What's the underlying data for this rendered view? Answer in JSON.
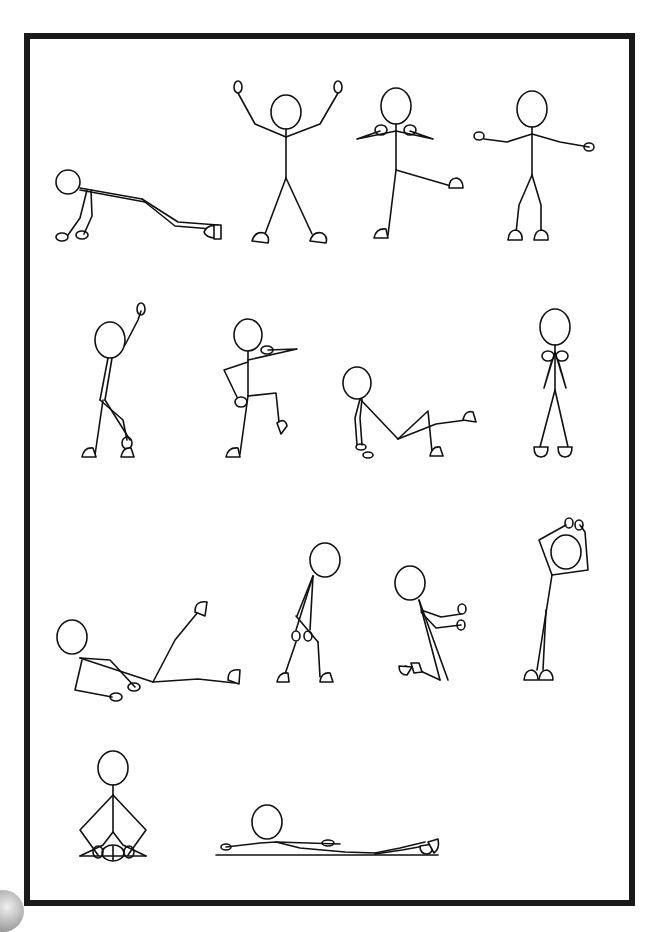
{
  "page": {
    "frame_color": "#1a1a1a",
    "background": "#ffffff",
    "line_color": "#111111"
  },
  "poses": [
    {
      "row": 1,
      "index": 1,
      "name": "plank / push-up"
    },
    {
      "row": 1,
      "index": 2,
      "name": "arms raised star stance"
    },
    {
      "row": 1,
      "index": 3,
      "name": "standing side leg kick"
    },
    {
      "row": 1,
      "index": 4,
      "name": "standing arms out"
    },
    {
      "row": 2,
      "index": 1,
      "name": "side stretch arm up"
    },
    {
      "row": 2,
      "index": 2,
      "name": "knee raise with arm point"
    },
    {
      "row": 2,
      "index": 3,
      "name": "seated leg raise"
    },
    {
      "row": 2,
      "index": 4,
      "name": "standing hands to chest"
    },
    {
      "row": 3,
      "index": 1,
      "name": "reclined leg raise"
    },
    {
      "row": 3,
      "index": 2,
      "name": "forward bend hands to knees"
    },
    {
      "row": 3,
      "index": 3,
      "name": "kneeling arms forward"
    },
    {
      "row": 3,
      "index": 4,
      "name": "overhead arm stretch"
    },
    {
      "row": 4,
      "index": 1,
      "name": "seated butterfly"
    },
    {
      "row": 4,
      "index": 2,
      "name": "lying down relaxation"
    }
  ]
}
